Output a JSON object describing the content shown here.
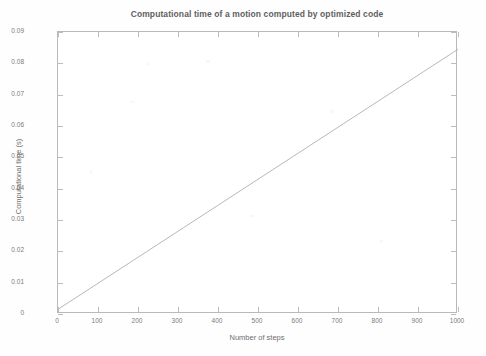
{
  "chart_data": {
    "type": "line",
    "title": "Computational time of a motion computed by optimized code",
    "xlabel": "Number of steps",
    "ylabel": "Computational time (s)",
    "xlim": [
      0,
      1000
    ],
    "ylim": [
      0,
      0.09
    ],
    "grid": false,
    "legend": null,
    "xticks": [
      0,
      100,
      200,
      300,
      400,
      500,
      600,
      700,
      800,
      900,
      1000
    ],
    "xtick_labels": [
      "0",
      "100",
      "200",
      "300",
      "400",
      "500",
      "600",
      "700",
      "800",
      "900",
      "1000"
    ],
    "yticks": [
      0,
      0.01,
      0.02,
      0.03,
      0.04,
      0.05,
      0.06,
      0.07,
      0.08,
      0.09
    ],
    "ytick_labels": [
      "0",
      "0.01",
      "0.02",
      "0.03",
      "0.04",
      "0.05",
      "0.06",
      "0.07",
      "0.08",
      "0.09"
    ],
    "series": [
      {
        "name": "Computational time",
        "color": "#b0b0b0",
        "x": [
          0,
          100,
          200,
          300,
          400,
          500,
          600,
          700,
          800,
          900,
          1000
        ],
        "values": [
          0.0015,
          0.0098,
          0.0181,
          0.0264,
          0.0347,
          0.043,
          0.0513,
          0.0596,
          0.0679,
          0.0762,
          0.0845
        ]
      }
    ]
  },
  "figure": {
    "background_color": "#fefefe",
    "axis_color": "#b9b9b9",
    "text_color": "#6e6e6e",
    "line_color": "#b0b0b0"
  }
}
